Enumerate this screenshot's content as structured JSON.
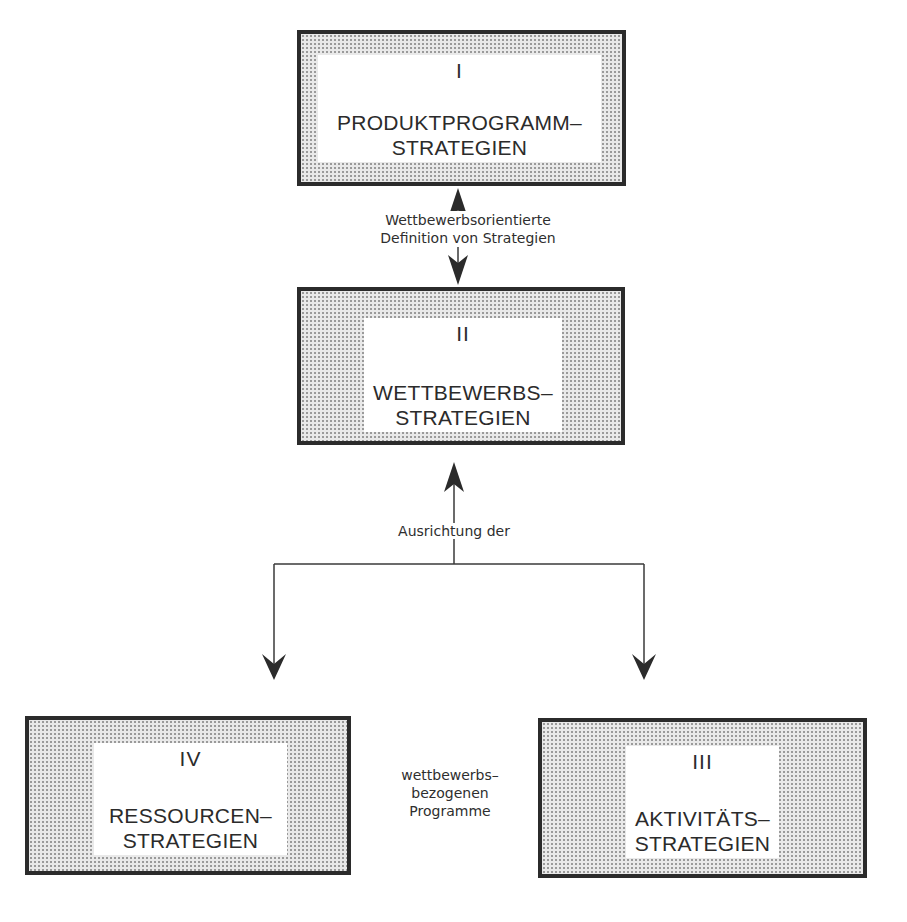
{
  "diagram": {
    "boxes": [
      {
        "id": "I",
        "numeral": "I",
        "title_line1": "PRODUKTPROGRAMM–",
        "title_line2": "STRATEGIEN"
      },
      {
        "id": "II",
        "numeral": "II",
        "title_line1": "WETTBEWERBS–",
        "title_line2": "STRATEGIEN"
      },
      {
        "id": "III",
        "numeral": "III",
        "title_line1": "AKTIVITÄTS–",
        "title_line2": "STRATEGIEN"
      },
      {
        "id": "IV",
        "numeral": "IV",
        "title_line1": "RESSOURCEN–",
        "title_line2": "STRATEGIEN"
      }
    ],
    "labels": {
      "between_I_II": {
        "line1": "Wettbewerbsorientierte",
        "line2": "Definition von Strategien"
      },
      "alignment": "Ausrichtung der",
      "programs": {
        "line1": "wettbewerbs–",
        "line2": "bezogenen",
        "line3": "Programme"
      }
    },
    "colors": {
      "border": "#2b2b2b",
      "fill_dots": "#9a9a9a",
      "inner": "#ffffff",
      "line": "#3a3a3a"
    }
  }
}
